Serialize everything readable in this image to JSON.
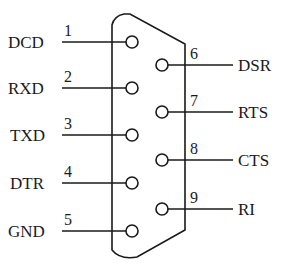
{
  "diagram": {
    "connector": "DB9",
    "stroke_color": "#1a1a1a",
    "background": "#ffffff",
    "left_pins": [
      {
        "number": "1",
        "signal": "DCD",
        "y": 42
      },
      {
        "number": "2",
        "signal": "RXD",
        "y": 88
      },
      {
        "number": "3",
        "signal": "TXD",
        "y": 135
      },
      {
        "number": "4",
        "signal": "DTR",
        "y": 183
      },
      {
        "number": "5",
        "signal": "GND",
        "y": 231
      }
    ],
    "right_pins": [
      {
        "number": "6",
        "signal": "DSR",
        "y": 65
      },
      {
        "number": "7",
        "signal": "RTS",
        "y": 112
      },
      {
        "number": "8",
        "signal": "CTS",
        "y": 160
      },
      {
        "number": "9",
        "signal": "RI",
        "y": 209
      }
    ]
  }
}
